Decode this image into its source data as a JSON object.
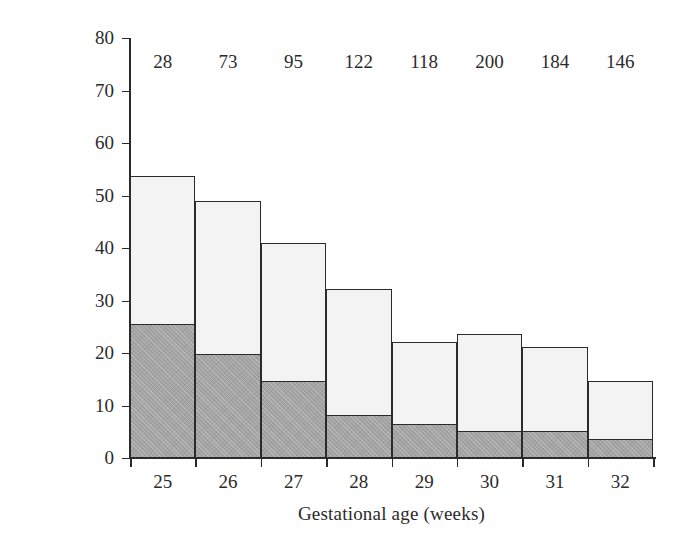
{
  "chart_data": {
    "type": "bar",
    "subtype": "stacked-bar",
    "title": "",
    "subtitle": "",
    "xlabel": "Gestational age (weeks)",
    "ylabel": "Percentage (%)",
    "categories": [
      "25",
      "26",
      "27",
      "28",
      "29",
      "30",
      "31",
      "32"
    ],
    "xtick_labels": [
      "25",
      "26",
      "27",
      "28",
      "29",
      "30",
      "31",
      "32"
    ],
    "ytick_labels": [
      "0",
      "10",
      "20",
      "30",
      "40",
      "50",
      "60",
      "70",
      "80"
    ],
    "ytick_values": [
      0,
      10,
      20,
      30,
      40,
      50,
      60,
      70,
      80
    ],
    "ylim": [
      0,
      80
    ],
    "grid": false,
    "legend": false,
    "legend_position": "none",
    "series": [
      {
        "name": "lower-segment",
        "color": "#a3a3a3",
        "values": [
          25.3,
          19.6,
          14.4,
          8.0,
          6.3,
          5.0,
          5.0,
          3.5
        ]
      },
      {
        "name": "upper-segment",
        "color": "#f3f3f3",
        "values": [
          28.4,
          29.4,
          26.6,
          24.1,
          15.8,
          18.7,
          16.2,
          11.1
        ]
      }
    ],
    "totals": [
      53.7,
      49.0,
      41.0,
      32.1,
      22.1,
      23.7,
      21.2,
      14.6
    ],
    "bar_annotations": [
      "28",
      "73",
      "95",
      "122",
      "118",
      "200",
      "184",
      "146"
    ],
    "annotation_note": "Counts (n) printed above each bar"
  },
  "colors": {
    "axis": "#2b2b2b",
    "text": "#2b2b2b",
    "light_segment": "#f3f3f3",
    "dark_segment": "#a3a3a3",
    "background": "#ffffff"
  }
}
